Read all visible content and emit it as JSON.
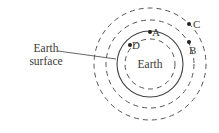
{
  "diagram": {
    "center": {
      "x": 150,
      "y": 64
    },
    "circles": [
      {
        "name": "inner-dashed-orbit",
        "r": 25,
        "style": "dashed"
      },
      {
        "name": "earth-surface",
        "r": 33,
        "style": "solid"
      },
      {
        "name": "middle-dashed-orbit",
        "r": 44,
        "style": "dashed"
      },
      {
        "name": "outer-dashed-orbit",
        "r": 56,
        "style": "dashed"
      }
    ],
    "earth_label": "Earth",
    "surface_label_line1": "Earth",
    "surface_label_line2": "surface",
    "points": [
      {
        "label": "A",
        "x": 150,
        "y": 32,
        "lx": 154,
        "ly": 35
      },
      {
        "label": "B",
        "x": 189,
        "y": 42,
        "lx": 190,
        "ly": 53
      },
      {
        "label": "C",
        "x": 189,
        "y": 24,
        "lx": 194,
        "ly": 28
      },
      {
        "label": "D",
        "x": 130,
        "y": 45,
        "lx": 133,
        "ly": 47
      }
    ],
    "stroke_color": "#555555"
  }
}
